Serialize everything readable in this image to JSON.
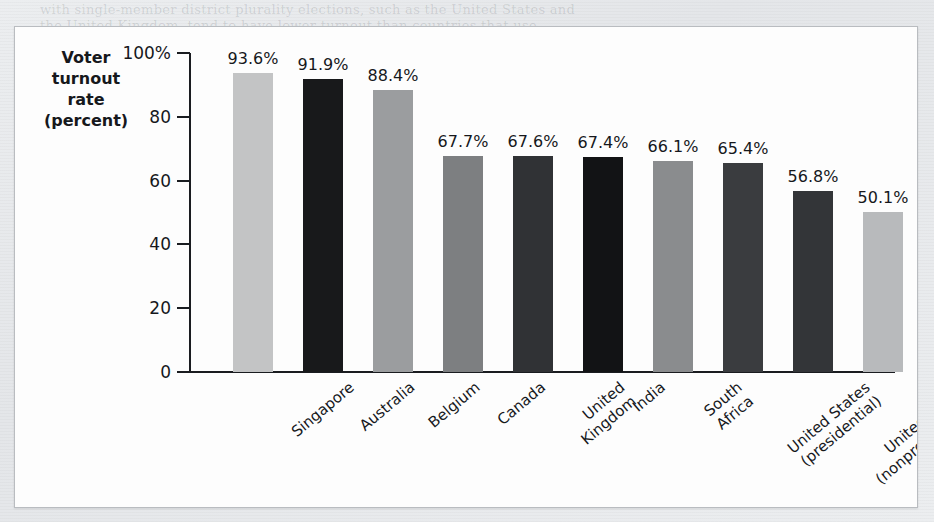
{
  "page": {
    "ghost_lines": [
      "with single-member district plurality elections, such as the United States and",
      "the United Kingdom, tend to have lower turnout than countries that use",
      "proportional representation systems with multiple parties.",
      "Voting is compulsory in Australia, Belgium, and Singapore.",
      "To raise turnout, some reformers have proposed making Election Day a",
      "national holiday or allowing same-day registration at the polling place."
    ],
    "ghost_side_lines": [
      "(a)",
      "language",
      "(b)"
    ]
  },
  "chart_data": {
    "type": "bar",
    "title": "",
    "xlabel": "",
    "ylabel": "Voter\nturnout\nrate\n(percent)",
    "ylabel_lines": [
      "Voter",
      "turnout",
      "rate",
      "(percent)"
    ],
    "ylim": [
      0,
      100
    ],
    "ytick_values": [
      100,
      80,
      60,
      40,
      20,
      0
    ],
    "ytick_labels": [
      "100%",
      "80",
      "60",
      "40",
      "20",
      "0"
    ],
    "grid": false,
    "legend": "none",
    "categories": [
      "Singapore",
      "Australia",
      "Belgium",
      "Canada",
      "United\nKingdom",
      "India",
      "South\nAfrica",
      "United States\n(presidential)",
      "United States\n(nonpresidential)",
      "Pakistan"
    ],
    "values": [
      93.6,
      91.9,
      88.4,
      67.7,
      67.6,
      67.4,
      66.1,
      65.4,
      56.8,
      50.1
    ],
    "value_labels": [
      "93.6%",
      "91.9%",
      "88.4%",
      "67.7%",
      "67.6%",
      "67.4%",
      "66.1%",
      "65.4%",
      "56.8%",
      "50.1%"
    ],
    "bar_colors": [
      "#c3c4c5",
      "#18191b",
      "#9b9d9f",
      "#7d7f81",
      "#303235",
      "#121315",
      "#8a8c8e",
      "#3a3c3f",
      "#333538",
      "#b8babc"
    ]
  },
  "colors": {
    "panel_background": "#fdfdfd",
    "panel_border": "#b9bcc0",
    "page_background": "#e9eaec",
    "axis": "#1a1c20",
    "text": "#16181c"
  }
}
